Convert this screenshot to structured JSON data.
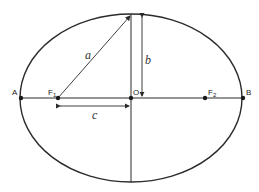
{
  "diagram": {
    "type": "ellipse-geometry",
    "colors": {
      "stroke": "#2a2a2a",
      "background": "#ffffff"
    },
    "ellipse": {
      "cx": 131,
      "cy": 98,
      "rx": 111,
      "ry": 84
    },
    "points": {
      "A": {
        "label": "A",
        "x": 21,
        "y": 98
      },
      "B": {
        "label": "B",
        "x": 243,
        "y": 98
      },
      "O": {
        "label": "O",
        "x": 131,
        "y": 98
      },
      "F1": {
        "label": "F",
        "sub": "1",
        "x": 58,
        "y": 98
      },
      "F2": {
        "label": "F",
        "sub": "2",
        "x": 205,
        "y": 98
      }
    },
    "segments": {
      "a": {
        "label": "a"
      },
      "b": {
        "label": "b"
      },
      "c": {
        "label": "c"
      }
    }
  }
}
